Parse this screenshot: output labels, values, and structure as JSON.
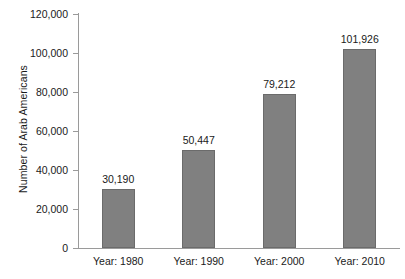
{
  "chart_data": {
    "type": "bar",
    "title": "",
    "subtitle": "",
    "xlabel": "",
    "ylabel": "Number of Arab Americans",
    "categories": [
      "Year: 1980",
      "Year: 1990",
      "Year: 2000",
      "Year: 2010"
    ],
    "values": [
      30190,
      50447,
      79212,
      101926
    ],
    "value_labels": [
      "30,190",
      "50,447",
      "79,212",
      "101,926"
    ],
    "ylim": [
      0,
      120000
    ],
    "ytick_values": [
      0,
      20000,
      40000,
      60000,
      80000,
      100000,
      120000
    ],
    "ytick_labels": [
      "0",
      "20,000",
      "40,000",
      "60,000",
      "80,000",
      "100,000",
      "120,000"
    ],
    "grid": false,
    "legend": false,
    "legend_position": "none",
    "bar_color": "#808080",
    "bar_edge_color": "#6b6b6b",
    "axis_color": "#9a9a9a",
    "background_color": "#ffffff",
    "text_color": "#1a1a1a"
  }
}
